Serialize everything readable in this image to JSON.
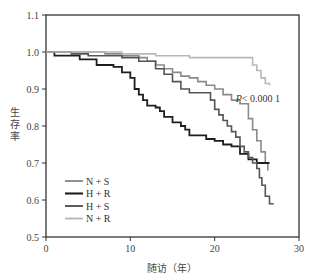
{
  "chart_data": {
    "type": "line",
    "subtype": "kaplan-meier-step",
    "title": "",
    "xlabel": "随访（年）",
    "ylabel": "生存率",
    "xlim": [
      0,
      30
    ],
    "ylim": [
      0.5,
      1.1
    ],
    "xticks": [
      0,
      10,
      20,
      30
    ],
    "yticks": [
      0.5,
      0.6,
      0.7,
      0.8,
      0.9,
      1.0,
      1.1
    ],
    "ytick_labels": [
      "0.5",
      "0.6",
      "0.7",
      "0.8",
      "0.9",
      "1.0",
      "1.1"
    ],
    "xtick_labels": [
      "0",
      "10",
      "20",
      "30"
    ],
    "grid": false,
    "legend_position": "lower-left",
    "annotation": {
      "text_italic": "P",
      "text": "< 0.000 1",
      "x": 22.5,
      "y": 0.865
    },
    "series": [
      {
        "name": "N + S",
        "color": "#8a8a8a",
        "width": 1.6,
        "points": [
          [
            0,
            1.0
          ],
          [
            7,
            0.995
          ],
          [
            9,
            0.99
          ],
          [
            11,
            0.985
          ],
          [
            12,
            0.975
          ],
          [
            13,
            0.965
          ],
          [
            14,
            0.955
          ],
          [
            15,
            0.945
          ],
          [
            16,
            0.935
          ],
          [
            17,
            0.93
          ],
          [
            18,
            0.92
          ],
          [
            19,
            0.91
          ],
          [
            20,
            0.9
          ],
          [
            21,
            0.885
          ],
          [
            22,
            0.87
          ],
          [
            23,
            0.86
          ],
          [
            24,
            0.82
          ],
          [
            24.5,
            0.79
          ],
          [
            25,
            0.76
          ],
          [
            25.5,
            0.73
          ],
          [
            26,
            0.7
          ],
          [
            26.3,
            0.68
          ]
        ]
      },
      {
        "name": "H + R",
        "color": "#1e1e1e",
        "width": 1.8,
        "points": [
          [
            0,
            1.0
          ],
          [
            1,
            0.99
          ],
          [
            4,
            0.98
          ],
          [
            6,
            0.965
          ],
          [
            8,
            0.96
          ],
          [
            9,
            0.945
          ],
          [
            10,
            0.93
          ],
          [
            10.5,
            0.9
          ],
          [
            11,
            0.885
          ],
          [
            11.5,
            0.87
          ],
          [
            12,
            0.855
          ],
          [
            13,
            0.85
          ],
          [
            13.5,
            0.84
          ],
          [
            14,
            0.825
          ],
          [
            15,
            0.81
          ],
          [
            16,
            0.8
          ],
          [
            16.5,
            0.79
          ],
          [
            17,
            0.775
          ],
          [
            18,
            0.775
          ],
          [
            19,
            0.765
          ],
          [
            20,
            0.76
          ],
          [
            21,
            0.75
          ],
          [
            22,
            0.745
          ],
          [
            23,
            0.725
          ],
          [
            24,
            0.71
          ],
          [
            25,
            0.7
          ],
          [
            26.5,
            0.7
          ]
        ]
      },
      {
        "name": "H + S",
        "color": "#555555",
        "width": 1.6,
        "points": [
          [
            0,
            1.0
          ],
          [
            3,
            0.995
          ],
          [
            5,
            0.99
          ],
          [
            9,
            0.985
          ],
          [
            11,
            0.975
          ],
          [
            13,
            0.955
          ],
          [
            14,
            0.94
          ],
          [
            15,
            0.92
          ],
          [
            16,
            0.9
          ],
          [
            17,
            0.89
          ],
          [
            19,
            0.89
          ],
          [
            19.5,
            0.87
          ],
          [
            20,
            0.845
          ],
          [
            20.5,
            0.83
          ],
          [
            21,
            0.815
          ],
          [
            21.5,
            0.8
          ],
          [
            22,
            0.785
          ],
          [
            22.5,
            0.77
          ],
          [
            23,
            0.745
          ],
          [
            23.5,
            0.73
          ],
          [
            24,
            0.715
          ],
          [
            24.5,
            0.7
          ],
          [
            25,
            0.685
          ],
          [
            25.3,
            0.66
          ],
          [
            25.6,
            0.64
          ],
          [
            26,
            0.61
          ],
          [
            26.5,
            0.59
          ],
          [
            27,
            0.59
          ]
        ]
      },
      {
        "name": "N + R",
        "color": "#b8b8b8",
        "width": 1.6,
        "points": [
          [
            0,
            1.0
          ],
          [
            9,
            0.995
          ],
          [
            13,
            0.99
          ],
          [
            17,
            0.985
          ],
          [
            24,
            0.985
          ],
          [
            24.5,
            0.965
          ],
          [
            25,
            0.95
          ],
          [
            25.5,
            0.93
          ],
          [
            26,
            0.915
          ],
          [
            26.5,
            0.91
          ]
        ]
      }
    ]
  }
}
